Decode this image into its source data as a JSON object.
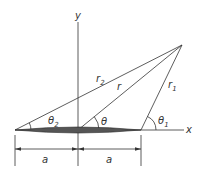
{
  "diagram": {
    "axes": {
      "x_label": "x",
      "y_label": "y"
    },
    "segments": {
      "r2": "r",
      "r2_sub": "2",
      "r": "r",
      "r1": "r",
      "r1_sub": "1"
    },
    "angles": {
      "theta2": "θ",
      "theta2_sub": "2",
      "theta": "θ",
      "theta1": "θ",
      "theta1_sub": "1"
    },
    "dimensions": {
      "left": "a",
      "right": "a"
    },
    "colors": {
      "line": "#333333",
      "background": "#ffffff"
    }
  }
}
